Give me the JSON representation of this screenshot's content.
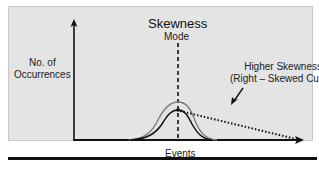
{
  "diagram": {
    "title": "Skewness",
    "mode_label": "Mode",
    "y_axis_label_line1": "No. of",
    "y_axis_label_line2": "Occurrences",
    "x_axis_label": "Events",
    "annotation_line1": "Higher Skewness",
    "annotation_line2": "(Right – Skewed Curve)",
    "colors": {
      "panel_background": "#e4e4e4",
      "axis": "#111111",
      "normal_curve": "#7a7a7a",
      "skewed_curve": "#111111",
      "dotted_tail": "#111111"
    },
    "elements": [
      {
        "name": "normal-curve",
        "description": "symmetric bell curve (gray)"
      },
      {
        "name": "skewed-curve",
        "description": "bell curve with peak at mode (black)"
      },
      {
        "name": "dotted-tail",
        "description": "dotted line extending right from peak to end of x-axis, indicating right skew"
      },
      {
        "name": "mode-line",
        "description": "vertical dashed line at the mode"
      }
    ]
  }
}
